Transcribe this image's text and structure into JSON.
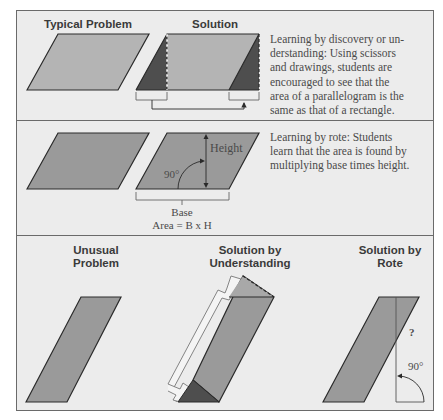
{
  "colors": {
    "background": "#ececec",
    "frame": "#6a6a6a",
    "shape_fill": "#9a9a9a",
    "shape_dark": "#4e4e4e",
    "outline": "#2a2a2a",
    "text": "#4a4a4a",
    "heading": "#3a3a3a"
  },
  "panels": [
    {
      "id": "discovery",
      "headings": [
        "Typical Problem",
        "Solution"
      ],
      "description": "Learning by discovery or un-derstanding: Using scissors and drawings, students are encouraged to see that the area of a parallelogram is the same as that of a rectangle.",
      "description_lines": [
        "Learning by discovery or un-",
        "derstanding:  Using scissors",
        "and drawings, students are",
        "encouraged to see that the",
        "area of a parallelogram is the",
        "same as that of a rectangle."
      ]
    },
    {
      "id": "rote",
      "labels": {
        "height": "Height",
        "angle": "90°",
        "base": "Base",
        "formula": "Area = B x H"
      },
      "description_lines": [
        "Learning by rote: Students",
        "learn that the area is found by",
        "multiplying base times height."
      ]
    },
    {
      "id": "unusual",
      "headings": {
        "problem": "Unusual\nProblem",
        "understanding": "Solution by\nUnderstanding",
        "rote": "Solution by\nRote"
      },
      "labels": {
        "question": "?",
        "angle": "90°"
      }
    }
  ]
}
